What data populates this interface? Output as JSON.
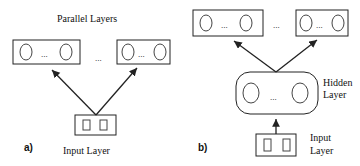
{
  "panel_a": {
    "label": "a)",
    "title": "Parallel Layers",
    "dots_between_layers": "...",
    "layer_dots": "...",
    "input_label": "Input Layer"
  },
  "panel_b": {
    "label": "b)",
    "dots_between_layers": "...",
    "layer_dots": "...",
    "hidden_label_line1": "Hidden",
    "hidden_label_line2": "Layer",
    "hidden_dots": "...",
    "input_label_line1": "Input",
    "input_label_line2": "Layer"
  },
  "colors": {
    "stroke": "#222222",
    "background": "#ffffff"
  }
}
